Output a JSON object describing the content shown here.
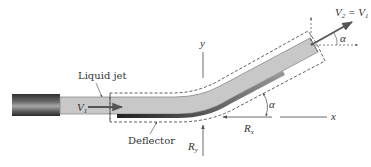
{
  "figure": {
    "type": "free-body / control-volume diagram",
    "labels": {
      "liquid_jet": "Liquid jet",
      "deflector": "Deflector",
      "inlet_velocity": "V",
      "inlet_velocity_sub": "1",
      "outlet_velocity_lhs": "V",
      "outlet_velocity_lhs_sub": "2",
      "outlet_velocity_eq": " = V",
      "outlet_velocity_rhs_sub": "1",
      "angle_exit": "α",
      "angle_deflector": "α",
      "reaction_x": "R",
      "reaction_x_sub": "x",
      "reaction_y": "R",
      "reaction_y_sub": "y",
      "axis_x": "x",
      "axis_y": "y"
    },
    "colors": {
      "jet_fill": "#c8c8c8",
      "jet_edge": "#8a8a8a",
      "nozzle_dark": "#3a3a3a",
      "nozzle_light": "#9a9a9a",
      "deflector_dark": "#2e2e2e",
      "arrow": "#555555",
      "dashed": "#333333",
      "text": "#333333"
    },
    "icons": {
      "nozzle": "nozzle-shape",
      "velocity_arrows": "arrow-icon"
    }
  }
}
